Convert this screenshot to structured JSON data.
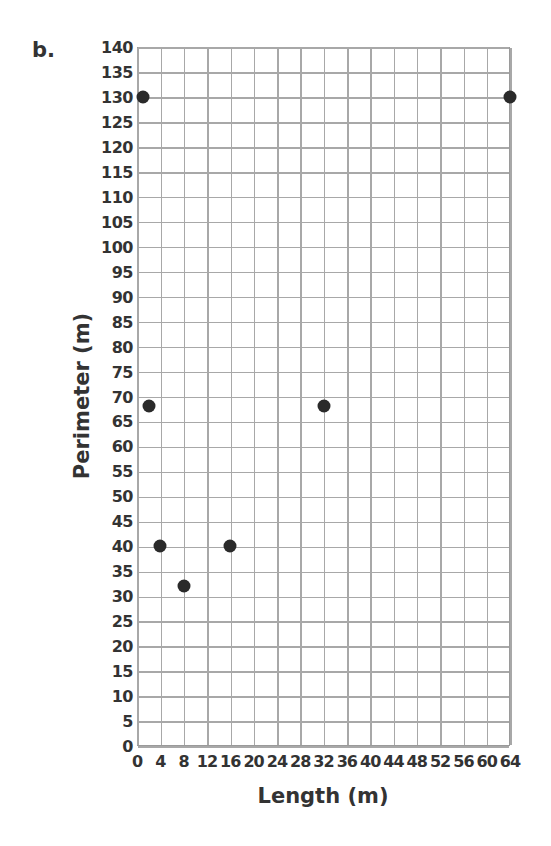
{
  "part_label": "b.",
  "colors": {
    "dot": "#2a2a2a",
    "grid": "#a8a8a8",
    "text": "#333333"
  },
  "chart_data": {
    "type": "scatter",
    "title": "",
    "xlabel": "Length (m)",
    "ylabel": "Perimeter (m)",
    "xlim": [
      0,
      64
    ],
    "ylim": [
      0,
      140
    ],
    "x_ticks": [
      0,
      4,
      8,
      12,
      16,
      20,
      24,
      28,
      32,
      36,
      40,
      44,
      48,
      52,
      56,
      60,
      64
    ],
    "y_ticks": [
      0,
      5,
      10,
      15,
      20,
      25,
      30,
      35,
      40,
      45,
      50,
      55,
      60,
      65,
      70,
      75,
      80,
      85,
      90,
      95,
      100,
      105,
      110,
      115,
      120,
      125,
      130,
      135,
      140
    ],
    "grid": true,
    "points": [
      {
        "x": 1,
        "y": 130
      },
      {
        "x": 2,
        "y": 68
      },
      {
        "x": 4,
        "y": 40
      },
      {
        "x": 8,
        "y": 32
      },
      {
        "x": 16,
        "y": 40
      },
      {
        "x": 32,
        "y": 68
      },
      {
        "x": 64,
        "y": 130
      }
    ]
  }
}
